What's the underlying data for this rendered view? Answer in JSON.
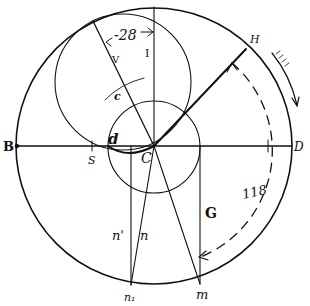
{
  "figure": {
    "type": "geometric construction",
    "colors": {
      "ink": "#111111",
      "paper": "#ffffff"
    }
  },
  "labels": {
    "B": "B",
    "D": "D",
    "H": "H",
    "I": "I",
    "V": "V",
    "c_upper": "c",
    "C_center": "C",
    "d": "d",
    "S": "S",
    "G": "G",
    "n": "n",
    "n_prime": "n'",
    "n1": "n₁",
    "m": "m",
    "dim_28": "-28",
    "dim_118": "118"
  },
  "geometry": {
    "center": [
      154,
      146
    ],
    "outer_circle_radius": 138,
    "inner_circle": {
      "center": [
        154,
        147
      ],
      "radius": 46
    },
    "middle_circle": {
      "center": [
        123,
        82
      ],
      "radius": 68
    },
    "dashed_arc_radius": 115
  }
}
